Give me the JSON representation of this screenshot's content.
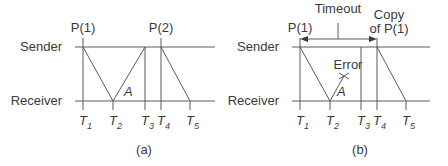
{
  "panels": [
    {
      "id": "a",
      "caption": "(a)",
      "sender_label": "Sender",
      "receiver_label": "Receiver",
      "packet_labels": {
        "p1": "P(1)",
        "p2": "P(2)"
      },
      "ack_label": "A",
      "time_marks": [
        {
          "base": "T",
          "sub": "1"
        },
        {
          "base": "T",
          "sub": "2"
        },
        {
          "base": "T",
          "sub": "3"
        },
        {
          "base": "T",
          "sub": "4"
        },
        {
          "base": "T",
          "sub": "5"
        }
      ]
    },
    {
      "id": "b",
      "caption": "(b)",
      "sender_label": "Sender",
      "receiver_label": "Receiver",
      "packet_labels": {
        "p1": "P(1)",
        "copy_line1": "Copy",
        "copy_line2": "of P(1)"
      },
      "ack_label": "A",
      "error_label": "Error",
      "timeout_label": "Timeout",
      "time_marks": [
        {
          "base": "T",
          "sub": "1"
        },
        {
          "base": "T",
          "sub": "2"
        },
        {
          "base": "T",
          "sub": "3"
        },
        {
          "base": "T",
          "sub": "4"
        },
        {
          "base": "T",
          "sub": "5"
        }
      ]
    }
  ],
  "colors": {
    "line": "#555555",
    "text": "#3a3a3a",
    "background": "#ffffff"
  }
}
